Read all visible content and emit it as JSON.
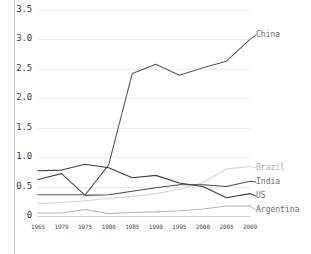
{
  "chart_data": {
    "type": "line",
    "title": "",
    "subtitle": "",
    "xlabel": "",
    "ylabel": "",
    "x": [
      1965,
      1970,
      1975,
      1980,
      1985,
      1990,
      1995,
      2000,
      2005,
      2009
    ],
    "xtick_labels": [
      "1965",
      "1970",
      "1975",
      "1980",
      "1985",
      "1990",
      "1995",
      "2000",
      "2005",
      "2009"
    ],
    "ytick_labels": [
      "3.5",
      "3.0",
      "2.5",
      "2.0",
      "1.5",
      "1.0",
      "0.5",
      "0"
    ],
    "ytick_values": [
      3.5,
      3.0,
      2.5,
      2.0,
      1.5,
      1.0,
      0.5,
      0
    ],
    "ylim": [
      0,
      3.5
    ],
    "xlim": [
      1965,
      2009
    ],
    "grid": "horizontal",
    "legend_position": "right-edge-labels",
    "series": [
      {
        "name": "China",
        "color": "#595959",
        "label_color": "#6d6d6d",
        "values": [
          0.36,
          0.36,
          0.36,
          0.87,
          2.42,
          2.58,
          2.39,
          2.52,
          2.63,
          3.0
        ]
      },
      {
        "name": "Brazil",
        "color": "#d6d6d6",
        "label_color": "#b0b0b0",
        "values": [
          0.21,
          0.23,
          0.26,
          0.3,
          0.33,
          0.38,
          0.45,
          0.57,
          0.8,
          0.84
        ]
      },
      {
        "name": "India",
        "color": "#4a4a4a",
        "label_color": "#6d6d6d",
        "values": [
          0.62,
          0.72,
          0.35,
          0.36,
          0.42,
          0.48,
          0.53,
          0.53,
          0.5,
          0.59
        ]
      },
      {
        "name": "US",
        "color": "#3d3d3d",
        "label_color": "#6d6d6d",
        "values": [
          0.77,
          0.78,
          0.88,
          0.82,
          0.65,
          0.69,
          0.56,
          0.5,
          0.31,
          0.38
        ]
      },
      {
        "name": "Argentina",
        "color": "#b8b8b8",
        "label_color": "#6d6d6d",
        "values": [
          0.05,
          0.05,
          0.11,
          0.04,
          0.06,
          0.07,
          0.09,
          0.12,
          0.17,
          0.17
        ]
      }
    ],
    "series_end_labels": [
      {
        "name": "China",
        "y_px_fraction": 0.143
      },
      {
        "name": "Brazil",
        "y_px_fraction": 0.767
      },
      {
        "name": "India",
        "y_px_fraction": 0.835
      },
      {
        "name": "US",
        "y_px_fraction": 0.903
      },
      {
        "name": "Argentina",
        "y_px_fraction": 0.976
      }
    ]
  }
}
